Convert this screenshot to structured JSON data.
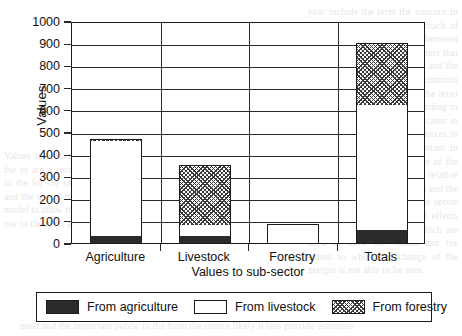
{
  "chart_data": {
    "type": "bar",
    "title": "",
    "xlabel": "Values to sub-sector",
    "ylabel": "Values",
    "categories": [
      "Agriculture",
      "Livestock",
      "Forestry",
      "Totals"
    ],
    "series": [
      {
        "name": "From agriculture",
        "values": [
          30,
          30,
          0,
          60
        ]
      },
      {
        "name": "From livestock",
        "values": [
          430,
          50,
          85,
          560
        ]
      },
      {
        "name": "From forestry",
        "values": [
          10,
          270,
          0,
          280
        ]
      }
    ],
    "stacked": true,
    "stack_tops": [
      470,
      350,
      85,
      900
    ],
    "ylim": [
      0,
      1000
    ],
    "yticks": [
      0,
      100,
      200,
      300,
      400,
      500,
      600,
      700,
      800,
      900,
      1000
    ],
    "ytick_labels": [
      "0",
      "100",
      "200",
      "300",
      "400",
      "500",
      "600",
      "700",
      "800",
      "900",
      "1000"
    ],
    "grid": true,
    "grid_axis": "y",
    "legend_position": "bottom",
    "colors": {
      "from_agriculture": "#2b2b2b",
      "from_livestock": "#ffffff",
      "from_forestry": "#3a3a3a",
      "axis": "#1a1a1a",
      "background": "#ffffff"
    }
  },
  "legend": {
    "items": [
      {
        "label": "From agriculture",
        "pattern": "solid-black"
      },
      {
        "label": "From livestock",
        "pattern": "white"
      },
      {
        "label": "From forestry",
        "pattern": "diagonal-hatch"
      }
    ]
  },
  "page_bleed": {
    "right": "year include the term the concern in the formulation and the approach of the model. The difference between the groups within the parameters that group are the most important and the value to which the data is a common one in the whole region and the level of supply in the sectors according to the approach is also an indicator in this way the carrying of resources in the small units is also important in the wider question of the use of the land in a sustainable way. A relative comparison of the production and the processing of the goods in the sector is able to show the different effects of the input to the sector which are used to show the values and the extent to which the change of the margin is not able to be seen.",
    "left": "Values to in the the country the to are a section of the to in the for the sector the data and the use of the land in the model to show the and the the use in the most and the",
    "bottom": "most and the important public in the from the source likely it less provide estimates"
  }
}
